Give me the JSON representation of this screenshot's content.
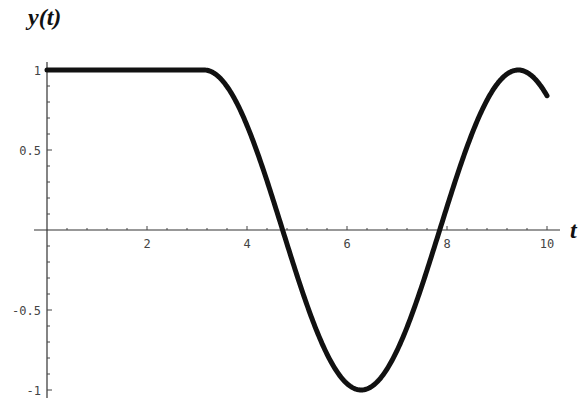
{
  "chart_data": {
    "type": "line",
    "title": "",
    "xlabel": "t",
    "ylabel": "y(t)",
    "xlim": [
      0,
      10
    ],
    "ylim": [
      -1,
      1
    ],
    "x_ticks": [
      "2",
      "4",
      "6",
      "8",
      "10"
    ],
    "y_ticks": [
      "1",
      "0.5",
      "-0.5",
      "-1"
    ],
    "grid": false,
    "legend": null,
    "series": [
      {
        "name": "y(t)",
        "description": "y = 1 for t < pi; y = -cos(t) for t >= pi",
        "x": [
          0,
          1,
          2,
          3,
          3.1416,
          3.5,
          4,
          4.5,
          4.712,
          5,
          5.5,
          6,
          6.283,
          6.5,
          7,
          7.5,
          7.854,
          8,
          8.5,
          9,
          9.425,
          9.5,
          10
        ],
        "values": [
          1,
          1,
          1,
          1,
          1,
          0.936,
          0.654,
          0.211,
          0,
          -0.284,
          -0.709,
          -0.96,
          -1,
          -0.977,
          -0.754,
          -0.347,
          0,
          0.146,
          0.602,
          0.911,
          1,
          0.997,
          0.839
        ]
      }
    ]
  },
  "labels": {
    "y_axis": "y(t)",
    "x_axis": "t",
    "x_ticks": [
      "2",
      "4",
      "6",
      "8",
      "10"
    ],
    "y_ticks": [
      "1",
      "0.5",
      "-0.5",
      "-1"
    ]
  }
}
